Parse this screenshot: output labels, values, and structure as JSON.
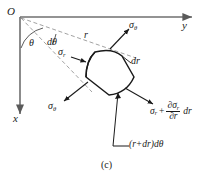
{
  "figure": {
    "caption": "(c)",
    "axes": {
      "origin_label": "O",
      "horizontal_axis_label": "y",
      "vertical_axis_label": "x"
    },
    "angles": {
      "theta_label": "θ",
      "dtheta_label": "dθ"
    },
    "radii": {
      "r_label": "r",
      "dr_label": "dr",
      "arc_length_label": "(r+dr)dθ"
    },
    "stresses": {
      "sigma_theta_top": {
        "base": "σ",
        "sub": "θ"
      },
      "sigma_theta_bottom": {
        "base": "σ",
        "sub": "θ"
      },
      "sigma_r_inner": {
        "base": "σ",
        "sub": "r"
      },
      "sigma_r_outer": {
        "base": "σ",
        "sub": "r",
        "plus": "+",
        "numerator_partial": "∂σ",
        "numerator_sub": "r",
        "denominator_partial": "∂",
        "denominator_var": "r",
        "differential": "dr"
      }
    },
    "colors": {
      "stroke": "#1a1a1a",
      "axis": "#6f6f6f",
      "dashed": "#8a8a8a",
      "background": "#ffffff"
    }
  }
}
